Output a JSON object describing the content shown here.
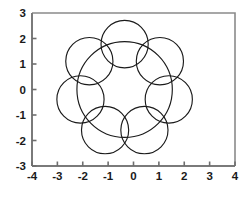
{
  "figure": {
    "width": 247,
    "height": 199,
    "background": "#ffffff"
  },
  "axes": {
    "frame_color": "#8a8a8a",
    "axis_color": "#7a7a7a",
    "tick_color": "#6e6e6e",
    "label_color": "#1a1a1a"
  },
  "chart_data": {
    "type": "line",
    "title": "",
    "xlabel": "",
    "ylabel": "",
    "xlim": [
      -4,
      4
    ],
    "ylim": [
      -3,
      3
    ],
    "grid": false,
    "legend": null,
    "x_ticks": [
      -4,
      -3,
      -2,
      -1,
      0,
      1,
      2,
      3,
      4
    ],
    "x_tick_labels": [
      "-4",
      "-3",
      "-2",
      "-1",
      "0",
      "1",
      "2",
      "3",
      "4"
    ],
    "y_ticks": [
      -3,
      -2,
      -1,
      0,
      1,
      2
    ],
    "y_tick_labels": [
      "-3",
      "-2",
      "-1",
      "0",
      "1",
      "2"
    ],
    "y_top_label": "3",
    "series": [
      {
        "name": "central-circle",
        "shape": "circle",
        "center": [
          -0.35,
          0.0
        ],
        "radius": 1.88,
        "stroke": "#1a1a1a",
        "fill": "none"
      },
      {
        "name": "petal-1",
        "shape": "circle",
        "center": [
          -0.35,
          1.78
        ],
        "radius": 0.93,
        "stroke": "#1a1a1a",
        "fill": "none"
      },
      {
        "name": "petal-2",
        "shape": "circle",
        "center": [
          1.04,
          1.11
        ],
        "radius": 0.93,
        "stroke": "#1a1a1a",
        "fill": "none"
      },
      {
        "name": "petal-3",
        "shape": "circle",
        "center": [
          1.39,
          -0.39
        ],
        "radius": 0.93,
        "stroke": "#1a1a1a",
        "fill": "none"
      },
      {
        "name": "petal-4",
        "shape": "circle",
        "center": [
          0.43,
          -1.59
        ],
        "radius": 0.93,
        "stroke": "#1a1a1a",
        "fill": "none"
      },
      {
        "name": "petal-5",
        "shape": "circle",
        "center": [
          -1.12,
          -1.59
        ],
        "radius": 0.93,
        "stroke": "#1a1a1a",
        "fill": "none"
      },
      {
        "name": "petal-6",
        "shape": "circle",
        "center": [
          -2.09,
          -0.39
        ],
        "radius": 0.93,
        "stroke": "#1a1a1a",
        "fill": "none"
      },
      {
        "name": "petal-7",
        "shape": "circle",
        "center": [
          -1.74,
          1.11
        ],
        "radius": 0.93,
        "stroke": "#1a1a1a",
        "fill": "none"
      }
    ]
  }
}
